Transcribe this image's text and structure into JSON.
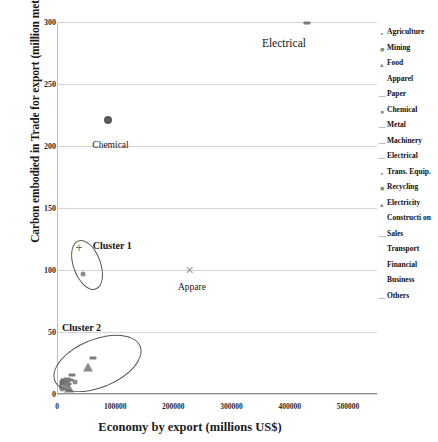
{
  "chart_data": {
    "type": "scatter",
    "title": "",
    "xlabel": "Economy by export (millions US$)",
    "ylabel": "Carbon embodied in Trade for export (million metic tonns)",
    "xlim": [
      0,
      550000
    ],
    "ylim": [
      0,
      300
    ],
    "xticks": [
      "0",
      "100000",
      "200000",
      "300000",
      "400000",
      "500000"
    ],
    "xtick_values": [
      0,
      100000,
      200000,
      300000,
      400000,
      500000
    ],
    "yticks": [
      "0",
      "50",
      "100",
      "150",
      "200",
      "250",
      "300"
    ],
    "ytick_values": [
      0,
      50,
      100,
      150,
      200,
      250,
      300
    ],
    "grid": true,
    "legend_position": "right",
    "series": [
      {
        "name": "Agriculture",
        "marker": "dot",
        "points": [
          {
            "x": 9000,
            "y": 6
          }
        ]
      },
      {
        "name": "Mining",
        "marker": "square",
        "points": [
          {
            "x": 14000,
            "y": 9
          }
        ]
      },
      {
        "name": "Food",
        "marker": "triangle",
        "points": [
          {
            "x": 21000,
            "y": 5
          }
        ]
      },
      {
        "name": "Apparel",
        "marker": "x",
        "points": [
          {
            "x": 228000,
            "y": 100
          }
        ]
      },
      {
        "name": "Paper",
        "marker": "dash",
        "points": [
          {
            "x": 17000,
            "y": 12
          }
        ]
      },
      {
        "name": "Chemical",
        "marker": "circle",
        "points": [
          {
            "x": 88000,
            "y": 221
          }
        ]
      },
      {
        "name": "Metal",
        "marker": "dash",
        "points": [
          {
            "x": 26000,
            "y": 15
          }
        ]
      },
      {
        "name": "Machinery",
        "marker": "dash",
        "points": [
          {
            "x": 62000,
            "y": 29
          }
        ]
      },
      {
        "name": "Electrical",
        "marker": "dash",
        "points": [
          {
            "x": 430000,
            "y": 299
          }
        ]
      },
      {
        "name": "Trans. Equip.",
        "marker": "dot",
        "points": [
          {
            "x": 31000,
            "y": 10
          }
        ]
      },
      {
        "name": "Recycling",
        "marker": "square",
        "points": [
          {
            "x": 12000,
            "y": 7
          }
        ]
      },
      {
        "name": "Electricity",
        "marker": "triangle",
        "points": [
          {
            "x": 54000,
            "y": 22
          }
        ]
      },
      {
        "name": "Construction",
        "marker": "dot",
        "points": [
          {
            "x": 8000,
            "y": 4
          }
        ]
      },
      {
        "name": "Sales",
        "marker": "dash",
        "points": [
          {
            "x": 19000,
            "y": 8
          }
        ]
      },
      {
        "name": "Transport",
        "marker": "dot",
        "points": [
          {
            "x": 44000,
            "y": 97
          }
        ]
      },
      {
        "name": "Financial",
        "marker": "dot",
        "points": [
          {
            "x": 11000,
            "y": 6
          }
        ]
      },
      {
        "name": "Business",
        "marker": "dot",
        "points": [
          {
            "x": 16000,
            "y": 5
          }
        ]
      },
      {
        "name": "Others",
        "marker": "dash",
        "points": [
          {
            "x": 23000,
            "y": 11
          }
        ]
      }
    ],
    "annotations": [
      {
        "text": "Electrical",
        "x": 390000,
        "y": 288
      },
      {
        "text": "Chemical",
        "x": 92000,
        "y": 205
      },
      {
        "text": "Cluster 1",
        "x": 95000,
        "y": 124
      },
      {
        "text": "Appare",
        "x": 232000,
        "y": 90
      },
      {
        "text": "Cluster 2",
        "x": 42000,
        "y": 58
      }
    ],
    "cluster_outlines": [
      {
        "label": "Cluster 1",
        "shape": "ellipse",
        "cx": 50000,
        "cy": 105,
        "rx": 22000,
        "ry": 20,
        "rotation": -20
      },
      {
        "label": "Cluster 2",
        "shape": "ellipse",
        "cx": 68000,
        "cy": 25,
        "rx": 78000,
        "ry": 19,
        "rotation": -22
      }
    ]
  },
  "legend": {
    "items": [
      {
        "label": "Agriculture",
        "glyph": "▪"
      },
      {
        "label": "Mining",
        "glyph": "■"
      },
      {
        "label": "Food",
        "glyph": "▴"
      },
      {
        "label": "Apparel",
        "glyph": ""
      },
      {
        "label": "Paper",
        "glyph": "—"
      },
      {
        "label": "Chemical",
        "glyph": "●"
      },
      {
        "label": "Metal",
        "glyph": "—"
      },
      {
        "label": "Machinery",
        "glyph": "—"
      },
      {
        "label": "Electrical",
        "glyph": "—"
      },
      {
        "label": "Trans. Equip.",
        "glyph": "▪"
      },
      {
        "label": "Recycling",
        "glyph": "■"
      },
      {
        "label": "Electricity",
        "glyph": "▴"
      },
      {
        "label": "Constructi on",
        "glyph": ""
      },
      {
        "label": "Sales",
        "glyph": "—"
      },
      {
        "label": "Transport",
        "glyph": ""
      },
      {
        "label": "Financial",
        "glyph": ""
      },
      {
        "label": "Business",
        "glyph": ""
      },
      {
        "label": "Others",
        "glyph": "—"
      }
    ]
  },
  "axes": {
    "y_title": "Carbon embodied in Trade for export (million metic tonns)",
    "x_title": "Economy by export (millions US$)"
  }
}
